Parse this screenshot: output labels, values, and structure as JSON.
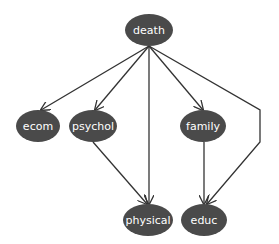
{
  "diagram": {
    "type": "directed-acyclic-graph",
    "colors": {
      "node_fill": "#4a4a4a",
      "edge": "#333333",
      "label": "#ffffff",
      "background": "#ffffff"
    },
    "nodes": [
      {
        "id": "death",
        "label": "death",
        "cx": 149,
        "cy": 30,
        "rx": 24,
        "ry": 16
      },
      {
        "id": "ecom",
        "label": "ecom",
        "cx": 38,
        "cy": 126,
        "rx": 22,
        "ry": 16
      },
      {
        "id": "psychol",
        "label": "psychol",
        "cx": 93,
        "cy": 126,
        "rx": 24,
        "ry": 16
      },
      {
        "id": "family",
        "label": "family",
        "cx": 203,
        "cy": 126,
        "rx": 23,
        "ry": 16
      },
      {
        "id": "physical",
        "label": "physical",
        "cx": 148,
        "cy": 220,
        "rx": 25,
        "ry": 16
      },
      {
        "id": "educ",
        "label": "educ",
        "cx": 204,
        "cy": 220,
        "rx": 23,
        "ry": 16
      }
    ],
    "edges": [
      {
        "from": "death",
        "to": "ecom"
      },
      {
        "from": "death",
        "to": "psychol"
      },
      {
        "from": "death",
        "to": "physical"
      },
      {
        "from": "death",
        "to": "family"
      },
      {
        "from": "death",
        "to": "educ"
      },
      {
        "from": "psychol",
        "to": "physical"
      },
      {
        "from": "family",
        "to": "educ"
      }
    ]
  }
}
